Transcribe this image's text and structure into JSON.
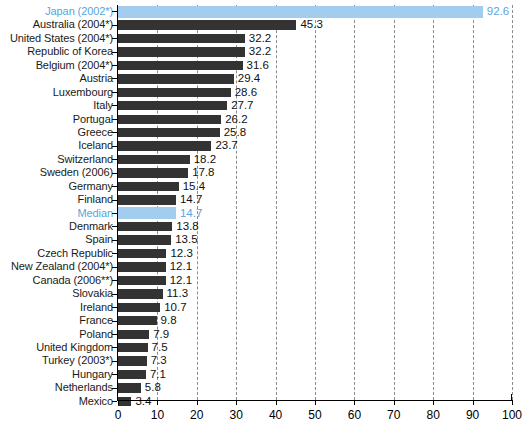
{
  "chart_data": {
    "type": "bar",
    "orientation": "horizontal",
    "title": "",
    "subtitle": "",
    "xlabel": "",
    "ylabel": "",
    "xlim": [
      0,
      100
    ],
    "xticks": [
      0,
      10,
      20,
      30,
      40,
      50,
      60,
      70,
      80,
      90,
      100
    ],
    "xtick_labels": [
      "0",
      "10",
      "20",
      "30",
      "40",
      "50",
      "60",
      "70",
      "80",
      "90",
      "100"
    ],
    "grid": "vertical-dashed",
    "legend": "none",
    "categories": [
      "Japan (2002*)",
      "Australia (2004*)",
      "United States (2004*)",
      "Republic of Korea",
      "Belgium (2004*)",
      "Austria",
      "Luxembourg",
      "Italy",
      "Portugal",
      "Greece",
      "Iceland",
      "Switzerland",
      "Sweden (2006)",
      "Germany",
      "Finland",
      "Median",
      "Denmark",
      "Spain",
      "Czech Republic",
      "New Zealand (2004*)",
      "Canada (2006**)",
      "Slovakia",
      "Ireland",
      "France",
      "Poland",
      "United Kingdom",
      "Turkey (2003*)",
      "Hungary",
      "Netherlands",
      "Mexico"
    ],
    "values": [
      92.6,
      45.3,
      32.2,
      32.2,
      31.6,
      29.4,
      28.6,
      27.7,
      26.2,
      25.8,
      23.7,
      18.2,
      17.8,
      15.4,
      14.7,
      14.7,
      13.8,
      13.5,
      12.3,
      12.1,
      12.1,
      11.3,
      10.7,
      9.8,
      7.9,
      7.5,
      7.3,
      7.1,
      5.8,
      3.4
    ],
    "value_labels": [
      "92.6",
      "45.3",
      "32.2",
      "32.2",
      "31.6",
      "29.4",
      "28.6",
      "27.7",
      "26.2",
      "25.8",
      "23.7",
      "18.2",
      "17.8",
      "15.4",
      "14.7",
      "14.7",
      "13.8",
      "13.5",
      "12.3",
      "12.1",
      "12.1",
      "11.3",
      "10.7",
      "9.8",
      "7.9",
      "7.5",
      "7.3",
      "7.1",
      "5.8",
      "3.4"
    ],
    "highlighted": [
      "Japan (2002*)",
      "Median"
    ],
    "colors": {
      "bar": "#333333",
      "bar_highlight": "#a2cdee",
      "label_highlight": "#5aa3dd",
      "label": "#1a1a1a",
      "axis": "#000000",
      "gridline": "#8c8c8c",
      "background": "#ffffff"
    }
  }
}
